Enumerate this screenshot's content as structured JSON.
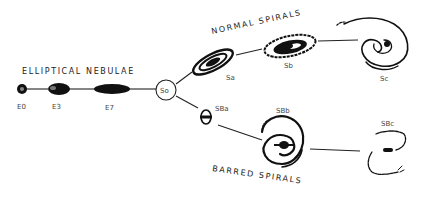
{
  "diagram": {
    "type": "hubble-tuning-fork",
    "headings": {
      "ellipticals": "ELLIPTICAL NEBULAE",
      "normal_spirals": "NORMAL SPIRALS",
      "barred_spirals": "BARRED SPIRALS"
    },
    "ellipticals": [
      {
        "label": "E0"
      },
      {
        "label": "E3"
      },
      {
        "label": "E7"
      }
    ],
    "lenticular": {
      "label": "So"
    },
    "normal_spirals": [
      {
        "label": "Sa"
      },
      {
        "label": "Sb"
      },
      {
        "label": "Sc"
      }
    ],
    "barred_spirals": [
      {
        "label": "SBa"
      },
      {
        "label": "SBb"
      },
      {
        "label": "SBc"
      }
    ],
    "colors": {
      "ink": "#111111",
      "background": "#ffffff"
    }
  }
}
